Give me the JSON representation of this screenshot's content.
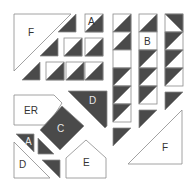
{
  "colors": {
    "dark": "#4a4a4a",
    "light": "#ffffff",
    "stroke": "#8a8a8a",
    "label_on_light": "#333333",
    "label_on_dark": "#e8e8e8"
  },
  "labels": {
    "f_top": "F",
    "a_top": "A",
    "b": "B",
    "er": "ER",
    "d_dark": "D",
    "c": "C",
    "a_bottom": "A",
    "d_bottom": "D",
    "e": "E",
    "f_bottom": "F"
  },
  "pieces": [
    {
      "id": "F",
      "shape": "triangle",
      "fill": "light"
    },
    {
      "id": "A",
      "shape": "half-square",
      "fill": "mixed"
    },
    {
      "id": "B",
      "shape": "square",
      "fill": "light"
    },
    {
      "id": "ER",
      "shape": "pentagon",
      "fill": "light"
    },
    {
      "id": "D",
      "shape": "parallelogram",
      "fill": "dark"
    },
    {
      "id": "C",
      "shape": "square",
      "fill": "dark"
    },
    {
      "id": "A",
      "shape": "triangle",
      "fill": "dark"
    },
    {
      "id": "D",
      "shape": "triangle",
      "fill": "light"
    },
    {
      "id": "E",
      "shape": "pentagon",
      "fill": "light"
    },
    {
      "id": "F",
      "shape": "triangle",
      "fill": "light"
    }
  ]
}
